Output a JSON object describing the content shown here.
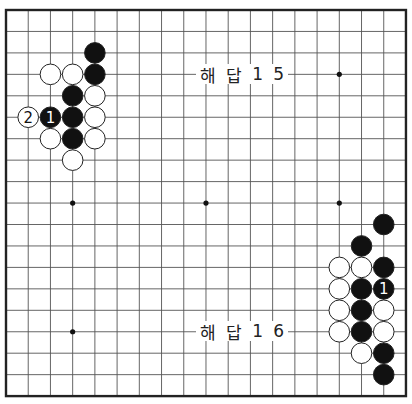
{
  "board": {
    "size": 19,
    "origin_x": 6,
    "origin_y": 10,
    "step_x": 22.22,
    "step_y": 21.45,
    "stone_radius": 10.3,
    "frame_color": "#222222",
    "line_color": "#555555",
    "black_color": "#111111",
    "white_color": "#ffffff",
    "star_points": [
      [
        3,
        9
      ],
      [
        9,
        9
      ],
      [
        15,
        9
      ],
      [
        15,
        3
      ],
      [
        3,
        15
      ]
    ]
  },
  "diagrams": [
    {
      "title_chars": [
        "해",
        "답",
        "1",
        "5"
      ],
      "title": "해답 15",
      "label_pos": {
        "x": 196,
        "y": 64,
        "w": 92
      },
      "stones": [
        {
          "c": 4,
          "r": 2,
          "color": "black"
        },
        {
          "c": 2,
          "r": 3,
          "color": "white"
        },
        {
          "c": 3,
          "r": 3,
          "color": "white"
        },
        {
          "c": 4,
          "r": 3,
          "color": "black"
        },
        {
          "c": 3,
          "r": 4,
          "color": "black"
        },
        {
          "c": 4,
          "r": 4,
          "color": "white"
        },
        {
          "c": 1,
          "r": 5,
          "color": "white",
          "label": "2"
        },
        {
          "c": 2,
          "r": 5,
          "color": "black",
          "label": "1"
        },
        {
          "c": 3,
          "r": 5,
          "color": "black"
        },
        {
          "c": 4,
          "r": 5,
          "color": "white"
        },
        {
          "c": 2,
          "r": 6,
          "color": "white"
        },
        {
          "c": 3,
          "r": 6,
          "color": "black"
        },
        {
          "c": 4,
          "r": 6,
          "color": "white"
        },
        {
          "c": 3,
          "r": 7,
          "color": "white"
        }
      ]
    },
    {
      "title_chars": [
        "해",
        "답",
        "1",
        "6"
      ],
      "title": "해답 16",
      "label_pos": {
        "x": 196,
        "y": 321,
        "w": 92
      },
      "stones": [
        {
          "c": 17,
          "r": 10,
          "color": "black"
        },
        {
          "c": 16,
          "r": 11,
          "color": "black"
        },
        {
          "c": 15,
          "r": 12,
          "color": "white"
        },
        {
          "c": 16,
          "r": 12,
          "color": "white"
        },
        {
          "c": 17,
          "r": 12,
          "color": "black"
        },
        {
          "c": 15,
          "r": 13,
          "color": "white"
        },
        {
          "c": 16,
          "r": 13,
          "color": "black"
        },
        {
          "c": 17,
          "r": 13,
          "color": "black",
          "label": "1"
        },
        {
          "c": 15,
          "r": 14,
          "color": "white"
        },
        {
          "c": 16,
          "r": 14,
          "color": "black"
        },
        {
          "c": 17,
          "r": 14,
          "color": "white"
        },
        {
          "c": 15,
          "r": 15,
          "color": "white"
        },
        {
          "c": 16,
          "r": 15,
          "color": "black"
        },
        {
          "c": 17,
          "r": 15,
          "color": "white"
        },
        {
          "c": 16,
          "r": 16,
          "color": "white"
        },
        {
          "c": 17,
          "r": 16,
          "color": "black"
        },
        {
          "c": 17,
          "r": 17,
          "color": "black"
        }
      ]
    }
  ]
}
